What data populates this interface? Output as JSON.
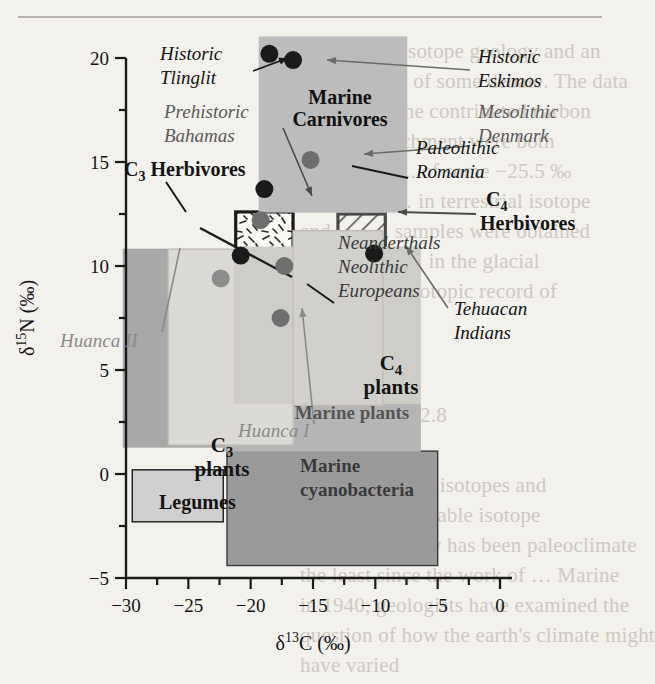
{
  "figure": {
    "background": "#f3f1ec",
    "axes": {
      "x": {
        "title_delta": "δ",
        "title_sup": "13",
        "title_elem": "C (‰)",
        "label": "δ13C (‰)",
        "ticks": [
          -30,
          -25,
          -20,
          -15,
          -10,
          -5,
          0
        ],
        "tick_labels": [
          "−30",
          "−25",
          "−20",
          "−15",
          "−10",
          "−5",
          "0"
        ],
        "min": -32.5,
        "max": 0.6,
        "minor_step": 2.5
      },
      "y": {
        "title_delta": "δ",
        "title_sup": "15",
        "title_elem": "N (‰)",
        "label": "δ15N (‰)",
        "ticks": [
          -5,
          0,
          5,
          10,
          15,
          20
        ],
        "tick_labels": [
          "−5",
          "0",
          "5",
          "10",
          "15",
          "20"
        ],
        "min": -7.6,
        "max": 21.2,
        "minor_step": 2.5
      }
    }
  },
  "chart_data": {
    "type": "scatter",
    "title": "",
    "xlabel": "δ13C (‰)",
    "ylabel": "δ15N (‰)",
    "xlim": [
      -32.5,
      0.6
    ],
    "ylim": [
      -7.6,
      21.2
    ],
    "grid": false,
    "legend": "none",
    "fields": [
      {
        "name": "C3 plants",
        "label": "C3 plants",
        "label_sub": "3",
        "label_line1": "C",
        "label_line2": "plants",
        "x0": -30.2,
        "x1": -21.8,
        "y0": 1.3,
        "y1": 10.8,
        "fill": "#a8a8a8",
        "stroke": "#a8a8a8",
        "style": "solid",
        "text_color": "#1a1a1a",
        "text_weight": "bold"
      },
      {
        "name": "Legumes",
        "label": "Legumes",
        "x0": -29.5,
        "x1": -22.2,
        "y0": -2.3,
        "y1": 0.2,
        "fill": "#cfcfcf",
        "stroke": "#1a1a1a",
        "style": "solid",
        "text_color": "#1a1a1a",
        "text_weight": "bold"
      },
      {
        "name": "Marine cyanobacteria",
        "label": "Marine cyanobacteria",
        "label_line1": "Marine",
        "label_line2": "cyanobacteria",
        "x0": -21.9,
        "x1": -5.0,
        "y0": -4.4,
        "y1": 1.1,
        "fill": "#9a9a9a",
        "stroke": "#3a3a3a",
        "style": "solid",
        "text_color": "#3a3a3a",
        "text_weight": "bold"
      },
      {
        "name": "Marine plants",
        "label": "Marine plants",
        "x0": -22.0,
        "x1": -6.4,
        "y0": 1.1,
        "y1": 3.4,
        "fill": "#b5b5b5",
        "stroke": "#b5b5b5",
        "style": "solid",
        "text_color": "#555555",
        "text_weight": "bold"
      },
      {
        "name": "C4 plants",
        "label": "C4 plants",
        "label_sub": "4",
        "label_line1": "C",
        "label_line2": "plants",
        "x0": -14.3,
        "x1": -9.8,
        "y0": 3.3,
        "y1": 10.2,
        "fill": "#e2e0db",
        "stroke": "#c3c0b8",
        "style": "solid",
        "text_color": "#1a1a1a",
        "text_weight": "bold"
      },
      {
        "name": "C3 Herbivores",
        "label": "C3 Herbivores",
        "label_sub": "3",
        "label_pre": "C",
        "label_post": " Herbivores",
        "x0": -21.2,
        "x1": -16.6,
        "y0": 4.4,
        "y1": 12.6,
        "fill": "none",
        "stroke": "#1a1a1a",
        "style": "dash-texture",
        "text_color": "#1a1a1a",
        "text_weight": "bold"
      },
      {
        "name": "C4 Herbivores",
        "label": "C4 Herbivores",
        "label_sub": "4",
        "label_line1": "C",
        "label_line2": "Herbivores",
        "x0": -13.0,
        "x1": -9.2,
        "y0": 4.7,
        "y1": 12.5,
        "fill": "none",
        "stroke": "#4a4a4a",
        "style": "hatch",
        "text_color": "#1a1a1a",
        "text_weight": "bold"
      },
      {
        "name": "Marine Carnivores",
        "label": "Marine Carnivores",
        "label_line1": "Marine",
        "label_line2": "Carnivores",
        "x0": -19.3,
        "x1": -7.5,
        "y0": 12.6,
        "y1": 21.0,
        "fill": "#bcbcbc",
        "stroke": "#bcbcbc",
        "style": "solid",
        "text_color": "#111111",
        "text_weight": "bold"
      },
      {
        "name": "Huanca II field",
        "label": "",
        "x0": -26.6,
        "x1": -16.6,
        "y0": 1.4,
        "y1": 10.8,
        "fill": "#dcdad5",
        "stroke": "#c6c3bc",
        "style": "solid",
        "text_color": "#777777",
        "text_weight": "normal"
      },
      {
        "name": "Huanca I field",
        "label": "",
        "x0": -21.3,
        "x1": -6.4,
        "y0": 3.4,
        "y1": 10.9,
        "fill": "#cfcdc7",
        "stroke": "#cfcdc7",
        "style": "solid",
        "text_color": "#777777",
        "text_weight": "normal"
      },
      {
        "name": "Neanderthals field",
        "label": "",
        "x0": -16.6,
        "x1": -9.4,
        "y0": 3.3,
        "y1": 11.7,
        "fill": "#d2d0ca",
        "stroke": "#c0bdb6",
        "style": "solid",
        "text_color": "#777777",
        "text_weight": "normal"
      }
    ],
    "points": [
      {
        "name": "Historic Tlinglit",
        "x": -18.5,
        "y": 20.2,
        "color": "#1a1a1a",
        "r": 9
      },
      {
        "name": "Historic Eskimos",
        "x": -16.6,
        "y": 19.9,
        "color": "#1a1a1a",
        "r": 9
      },
      {
        "name": "Paleolithic Romania",
        "x": -18.9,
        "y": 13.7,
        "color": "#1a1a1a",
        "r": 9
      },
      {
        "name": "Mesolithic Denmark",
        "x": -15.2,
        "y": 15.1,
        "color": "#6e6e6e",
        "r": 9
      },
      {
        "name": "Prehistoric Bahamas",
        "x": -19.2,
        "y": 12.2,
        "color": "#6e6e6e",
        "r": 9
      },
      {
        "name": "Tehuacan Indians",
        "x": -10.1,
        "y": 10.6,
        "color": "#1a1a1a",
        "r": 9
      },
      {
        "name": "C3 Herbivores point",
        "x": -20.8,
        "y": 10.5,
        "color": "#1a1a1a",
        "r": 9
      },
      {
        "name": "Neanderthals point",
        "x": -17.3,
        "y": 10.0,
        "color": "#6e6e6e",
        "r": 9
      },
      {
        "name": "Huanca II point",
        "x": -22.4,
        "y": 9.4,
        "color": "#8c8c8c",
        "r": 9
      },
      {
        "name": "Huanca I point",
        "x": -17.6,
        "y": 7.5,
        "color": "#6e6e6e",
        "r": 9
      }
    ],
    "annotations": [
      {
        "name": "Historic Tlinglit",
        "line1": "Historic",
        "line2": "Tlinglit",
        "style": "italic",
        "color": "#141414"
      },
      {
        "name": "Historic Eskimos",
        "line1": "Historic",
        "line2": "Eskimos",
        "style": "italic",
        "color": "#141414"
      },
      {
        "name": "Prehistoric Bahamas",
        "line1": "Prehistoric",
        "line2": "Bahamas",
        "style": "italic",
        "color": "#5a5a5a"
      },
      {
        "name": "Mesolithic Denmark",
        "line1": "Mesolithic",
        "line2": "Denmark",
        "style": "italic",
        "color": "#5a5a5a"
      },
      {
        "name": "Paleolithic Romania",
        "line1": "Paleolithic",
        "line2": "Romania",
        "style": "italic",
        "color": "#141414"
      },
      {
        "name": "Neanderthals Neolithic Europeans",
        "line1": "Neanderthals",
        "line2": "Neolithic",
        "line3": "Europeans",
        "style": "italic",
        "color": "#3a3a3a"
      },
      {
        "name": "Tehuacan Indians",
        "line1": "Tehuacan",
        "line2": "Indians",
        "style": "italic",
        "color": "#141414"
      },
      {
        "name": "Huanca II",
        "line1": "Huanca II",
        "style": "italic",
        "color": "#8a8a8a"
      },
      {
        "name": "Huanca I",
        "line1": "Huanca I",
        "style": "italic",
        "color": "#8a8a8a"
      }
    ]
  },
  "bleed_text": [
    {
      "t": "of … isotope geology and an",
      "x": 352,
      "y": 36
    },
    {
      "t": "still a matter of some debate. The data",
      "x": 300,
      "y": 66
    },
    {
      "t": "that not all the contributed carbon",
      "x": 300,
      "y": 96
    },
    {
      "t": "isotope enrichment  were both",
      "x": 300,
      "y": 126
    },
    {
      "t": "at ab. 2011 ... of some  −25.5 ‰",
      "x": 300,
      "y": 156
    },
    {
      "t": "in organic … in terrestrial isotope",
      "x": 300,
      "y": 186
    },
    {
      "t": "and the … samples were obtained",
      "x": 300,
      "y": 216
    },
    {
      "t": "Quaternary … in the glacial",
      "x": 300,
      "y": 246
    },
    {
      "t": "from … the isotopic record of",
      "x": 300,
      "y": 276
    },
    {
      "t": "the last …",
      "x": 300,
      "y": 306
    },
    {
      "t": "2.8",
      "x": 420,
      "y": 400
    },
    {
      "t": "Perspectives  on isotopes and",
      "x": 300,
      "y": 470
    },
    {
      "t": "significant … stable isotope",
      "x": 300,
      "y": 500
    },
    {
      "t": "geothermometry  has been paleoclimate",
      "x": 300,
      "y": 530
    },
    {
      "t": "the least since the work of  … Marine",
      "x": 300,
      "y": 560
    },
    {
      "t": "in 1940, geologists have examined the",
      "x": 300,
      "y": 590
    },
    {
      "t": "question of how the earth's climate might",
      "x": 300,
      "y": 620
    },
    {
      "t": "have varied",
      "x": 300,
      "y": 650
    }
  ]
}
